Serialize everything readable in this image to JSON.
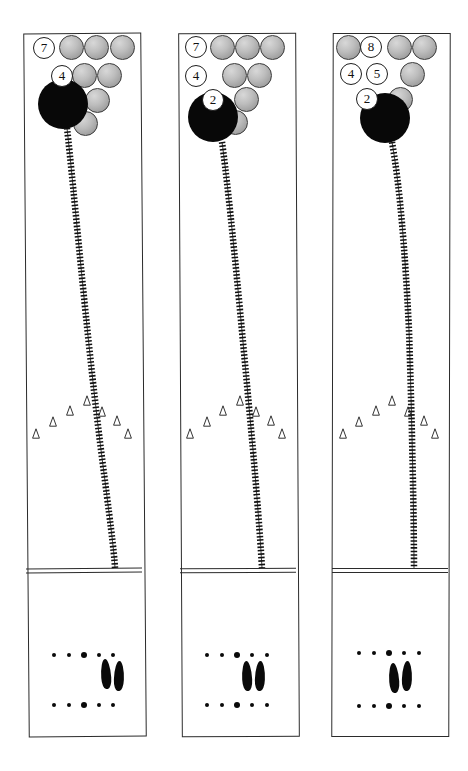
{
  "figure": {
    "type": "bowling-lane-diagram",
    "width": 468,
    "height": 771,
    "background_color": "#ffffff",
    "line_color": "#2b2b2b",
    "ball_color": "#080808",
    "pin_fill_color": "#bdbdbd",
    "pin_outline_color": "#3a3a3a",
    "label_text_color": "#111111",
    "panel_count": 3
  },
  "panels": [
    {
      "id": "panel-1",
      "name": "lane-diagram-left",
      "frame": {
        "x": 26,
        "y": 33,
        "w": 116,
        "h": 702
      },
      "foul_line_y": 568,
      "pin_labels": [
        {
          "text": "7",
          "x": 44,
          "y": 48
        },
        {
          "text": "4",
          "x": 62,
          "y": 76
        }
      ],
      "pins": [
        {
          "row": 1,
          "slot": 1,
          "x": 71,
          "y": 47
        },
        {
          "row": 1,
          "slot": 2,
          "x": 96,
          "y": 47
        },
        {
          "row": 1,
          "slot": 3,
          "x": 122,
          "y": 47
        },
        {
          "row": 2,
          "slot": 2,
          "x": 84,
          "y": 75
        },
        {
          "row": 2,
          "slot": 3,
          "x": 109,
          "y": 75
        },
        {
          "row": 3,
          "slot": 2,
          "x": 72,
          "y": 98
        },
        {
          "row": 3,
          "slot": 3,
          "x": 97,
          "y": 100
        },
        {
          "row": 4,
          "slot": 1,
          "x": 85,
          "y": 123
        }
      ],
      "ball": {
        "x": 63,
        "y": 104,
        "r": 25
      },
      "ball_path": "M 67 128 C 74 190, 86 330, 101 450 C 110 520, 114 550, 115 568",
      "arrows": [
        {
          "x": 36,
          "y": 433
        },
        {
          "x": 53,
          "y": 421
        },
        {
          "x": 70,
          "y": 410
        },
        {
          "x": 87,
          "y": 400
        },
        {
          "x": 102,
          "y": 411
        },
        {
          "x": 117,
          "y": 420
        },
        {
          "x": 128,
          "y": 433
        }
      ],
      "dot_rows": [
        {
          "y": 655,
          "dots": [
            {
              "x": 54,
              "r": 2.2
            },
            {
              "x": 69,
              "r": 2.2
            },
            {
              "x": 84,
              "r": 3.2
            },
            {
              "x": 99,
              "r": 2.2
            },
            {
              "x": 113,
              "r": 2.2
            }
          ]
        },
        {
          "y": 705,
          "dots": [
            {
              "x": 54,
              "r": 2.2
            },
            {
              "x": 69,
              "r": 2.2
            },
            {
              "x": 84,
              "r": 3.2
            },
            {
              "x": 99,
              "r": 2.2
            },
            {
              "x": 113,
              "r": 2.2
            }
          ]
        }
      ],
      "footprints": [
        {
          "x": 101,
          "y": 659,
          "w": 10,
          "h": 30,
          "rot": -4
        },
        {
          "x": 114,
          "y": 661,
          "w": 10,
          "h": 30,
          "rot": 2
        }
      ]
    },
    {
      "id": "panel-2",
      "name": "lane-diagram-center",
      "frame": {
        "x": 180,
        "y": 33,
        "w": 116,
        "h": 702
      },
      "foul_line_y": 568,
      "pin_labels": [
        {
          "text": "7",
          "x": 196,
          "y": 47
        },
        {
          "text": "4",
          "x": 196,
          "y": 76
        },
        {
          "text": "2",
          "x": 213,
          "y": 100
        }
      ],
      "pins": [
        {
          "row": 1,
          "slot": 1,
          "x": 222,
          "y": 47
        },
        {
          "row": 1,
          "slot": 2,
          "x": 247,
          "y": 47
        },
        {
          "row": 1,
          "slot": 3,
          "x": 272,
          "y": 47
        },
        {
          "row": 2,
          "slot": 2,
          "x": 234,
          "y": 75
        },
        {
          "row": 2,
          "slot": 3,
          "x": 259,
          "y": 75
        },
        {
          "row": 3,
          "slot": 3,
          "x": 246,
          "y": 99
        },
        {
          "row": 4,
          "slot": 1,
          "x": 235,
          "y": 122
        }
      ],
      "ball": {
        "x": 213,
        "y": 117,
        "r": 25
      },
      "ball_path": "M 222 142 C 230 200, 242 330, 253 450 C 259 520, 261 550, 262 568",
      "arrows": [
        {
          "x": 190,
          "y": 433
        },
        {
          "x": 207,
          "y": 421
        },
        {
          "x": 223,
          "y": 410
        },
        {
          "x": 240,
          "y": 400
        },
        {
          "x": 256,
          "y": 411
        },
        {
          "x": 271,
          "y": 420
        },
        {
          "x": 282,
          "y": 433
        }
      ],
      "dot_rows": [
        {
          "y": 655,
          "dots": [
            {
              "x": 207,
              "r": 2.2
            },
            {
              "x": 222,
              "r": 2.2
            },
            {
              "x": 237,
              "r": 3.2
            },
            {
              "x": 252,
              "r": 2.2
            },
            {
              "x": 267,
              "r": 2.2
            }
          ]
        },
        {
          "y": 705,
          "dots": [
            {
              "x": 207,
              "r": 2.2
            },
            {
              "x": 222,
              "r": 2.2
            },
            {
              "x": 237,
              "r": 3.2
            },
            {
              "x": 252,
              "r": 2.2
            },
            {
              "x": 267,
              "r": 2.2
            }
          ]
        }
      ],
      "footprints": [
        {
          "x": 242,
          "y": 661,
          "w": 10,
          "h": 30,
          "rot": -3
        },
        {
          "x": 255,
          "y": 661,
          "w": 10,
          "h": 30,
          "rot": 2
        }
      ]
    },
    {
      "id": "panel-3",
      "name": "lane-diagram-right",
      "frame": {
        "x": 332,
        "y": 33,
        "w": 116,
        "h": 702
      },
      "foul_line_y": 568,
      "pin_labels": [
        {
          "text": "8",
          "x": 371,
          "y": 47
        },
        {
          "text": "4",
          "x": 351,
          "y": 74
        },
        {
          "text": "5",
          "x": 377,
          "y": 74
        },
        {
          "text": "2",
          "x": 367,
          "y": 99
        }
      ],
      "pins": [
        {
          "row": 1,
          "slot": 0,
          "x": 348,
          "y": 47
        },
        {
          "row": 1,
          "slot": 2,
          "x": 399,
          "y": 47
        },
        {
          "row": 1,
          "slot": 3,
          "x": 424,
          "y": 47
        },
        {
          "row": 2,
          "slot": 3,
          "x": 412,
          "y": 74
        },
        {
          "row": 3,
          "slot": 3,
          "x": 400,
          "y": 99
        },
        {
          "row": 4,
          "slot": 1,
          "x": 387,
          "y": 121
        }
      ],
      "ball": {
        "x": 385,
        "y": 118,
        "r": 25
      },
      "ball_path": "M 392 142 C 400 188, 405 250, 409 330 C 412 420, 414 520, 414 568",
      "arrows": [
        {
          "x": 343,
          "y": 433
        },
        {
          "x": 359,
          "y": 421
        },
        {
          "x": 376,
          "y": 410
        },
        {
          "x": 392,
          "y": 400
        },
        {
          "x": 408,
          "y": 411
        },
        {
          "x": 424,
          "y": 420
        },
        {
          "x": 435,
          "y": 433
        }
      ],
      "dot_rows": [
        {
          "y": 653,
          "dots": [
            {
              "x": 359,
              "r": 2.2
            },
            {
              "x": 374,
              "r": 2.2
            },
            {
              "x": 389,
              "r": 3.2
            },
            {
              "x": 404,
              "r": 2.2
            },
            {
              "x": 419,
              "r": 2.2
            }
          ]
        },
        {
          "y": 706,
          "dots": [
            {
              "x": 359,
              "r": 2.2
            },
            {
              "x": 374,
              "r": 2.2
            },
            {
              "x": 389,
              "r": 3.2
            },
            {
              "x": 404,
              "r": 2.2
            },
            {
              "x": 419,
              "r": 2.2
            }
          ]
        }
      ],
      "footprints": [
        {
          "x": 389,
          "y": 663,
          "w": 10,
          "h": 30,
          "rot": -4
        },
        {
          "x": 402,
          "y": 661,
          "w": 10,
          "h": 30,
          "rot": 2
        }
      ]
    }
  ]
}
